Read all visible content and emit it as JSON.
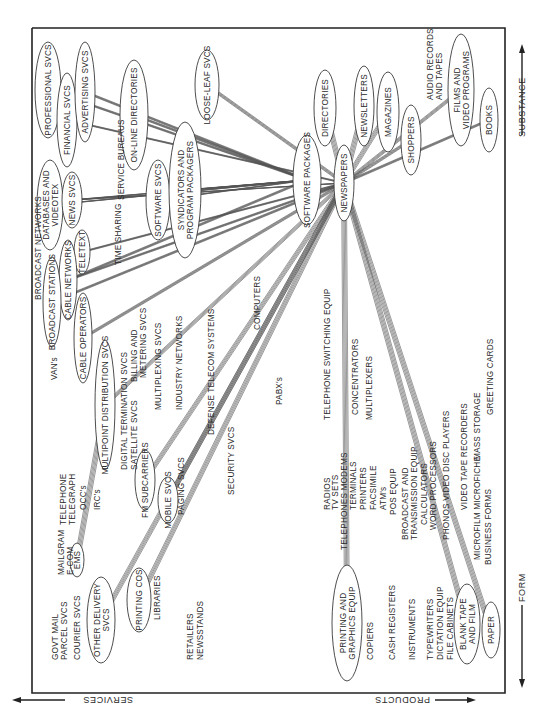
{
  "diagram": {
    "axes": {
      "top": "SUBSTANCE",
      "bottom": "FORM",
      "left": "SERVICES",
      "right": "PRODUCTS"
    },
    "nodes": [
      {
        "id": "professional",
        "lines": [
          "PROFESSIONAL SVCS"
        ],
        "cx": 48,
        "cy": 90,
        "rx": 13,
        "ry": 48
      },
      {
        "id": "financial",
        "lines": [
          "FINANCIAL SVCS"
        ],
        "cx": 67,
        "cy": 120,
        "rx": 10,
        "ry": 47
      },
      {
        "id": "advertising",
        "lines": [
          "ADVERTISING SVCS"
        ],
        "cx": 85,
        "cy": 92,
        "rx": 10,
        "ry": 50
      },
      {
        "id": "online-dir",
        "lines": [
          "ON-LINE DIRECTORIES"
        ],
        "cx": 134,
        "cy": 115,
        "rx": 14,
        "ry": 55
      },
      {
        "id": "loose-leaf",
        "lines": [
          "LOOSE-LEAF SVCS"
        ],
        "cx": 207,
        "cy": 85,
        "rx": 12,
        "ry": 35
      },
      {
        "id": "databases",
        "lines": [
          "DATABASES AND",
          "VIDEOTEX"
        ],
        "cx": 50,
        "cy": 205,
        "rx": 13,
        "ry": 45
      },
      {
        "id": "news-svcs",
        "lines": [
          "NEWS SVCS"
        ],
        "cx": 72,
        "cy": 200,
        "rx": 10,
        "ry": 28
      },
      {
        "id": "software-svcs",
        "lines": [
          "SOFTWARE SVCS"
        ],
        "cx": 158,
        "cy": 200,
        "rx": 12,
        "ry": 40
      },
      {
        "id": "syndicators",
        "lines": [
          "SYNDICATORS AND",
          "PROGRAM PACKAGERS"
        ],
        "cx": 185,
        "cy": 190,
        "rx": 16,
        "ry": 68
      },
      {
        "id": "teletext",
        "lines": [
          "TELETEXT"
        ],
        "cx": 82,
        "cy": 252,
        "rx": 8,
        "ry": 22
      },
      {
        "id": "cable-networks",
        "lines": [
          "CABLE NETWORKS"
        ],
        "cx": 68,
        "cy": 280,
        "rx": 9,
        "ry": 40
      },
      {
        "id": "broadcast-stations",
        "lines": [
          "BROADCAST STATIONS"
        ],
        "cx": 52,
        "cy": 302,
        "rx": 9,
        "ry": 45
      },
      {
        "id": "cable-operators",
        "lines": [
          "CABLE OPERATORS"
        ],
        "cx": 83,
        "cy": 338,
        "rx": 9,
        "ry": 45
      },
      {
        "id": "multipoint",
        "lines": [
          "MULTIPOINT DISTRIBUTION SVCS"
        ],
        "cx": 105,
        "cy": 405,
        "rx": 10,
        "ry": 65
      },
      {
        "id": "fm-subcarriers",
        "lines": [
          "FM SUBCARRIERS"
        ],
        "cx": 145,
        "cy": 480,
        "rx": 10,
        "ry": 30
      },
      {
        "id": "mobile-svcs",
        "lines": [
          "MOBILE SVCS"
        ],
        "cx": 168,
        "cy": 500,
        "rx": 10,
        "ry": 23
      },
      {
        "id": "ems",
        "lines": [
          "EMS"
        ],
        "cx": 77,
        "cy": 560,
        "rx": 7,
        "ry": 17
      },
      {
        "id": "other-delivery",
        "lines": [
          "OTHER DELIVERY",
          "SVCS"
        ],
        "cx": 101,
        "cy": 620,
        "rx": 14,
        "ry": 43
      },
      {
        "id": "printing-cos",
        "lines": [
          "PRINTING COS"
        ],
        "cx": 139,
        "cy": 600,
        "rx": 12,
        "ry": 32
      },
      {
        "id": "software-packages",
        "lines": [
          "SOFTWARE PACKAGES"
        ],
        "cx": 307,
        "cy": 180,
        "rx": 14,
        "ry": 45
      },
      {
        "id": "newspapers",
        "lines": [
          "NEWSPAPERS"
        ],
        "cx": 344,
        "cy": 183,
        "rx": 10,
        "ry": 38
      },
      {
        "id": "directories",
        "lines": [
          "DIRECTORIES"
        ],
        "cx": 325,
        "cy": 108,
        "rx": 11,
        "ry": 38
      },
      {
        "id": "newsletters",
        "lines": [
          "NEWSLETTERS"
        ],
        "cx": 364,
        "cy": 106,
        "rx": 10,
        "ry": 40
      },
      {
        "id": "magazines",
        "lines": [
          "MAGAZINES"
        ],
        "cx": 388,
        "cy": 112,
        "rx": 11,
        "ry": 40
      },
      {
        "id": "shoppers",
        "lines": [
          "SHOPPERS"
        ],
        "cx": 411,
        "cy": 140,
        "rx": 10,
        "ry": 35
      },
      {
        "id": "films",
        "lines": [
          "FILMS AND",
          "VIDEO PROGRAMS"
        ],
        "cx": 461,
        "cy": 90,
        "rx": 13,
        "ry": 56
      },
      {
        "id": "books",
        "lines": [
          "BOOKS"
        ],
        "cx": 489,
        "cy": 120,
        "rx": 9,
        "ry": 32
      },
      {
        "id": "printing-equip",
        "lines": [
          "PRINTING AND",
          "GRAPHICS EQUIP"
        ],
        "cx": 347,
        "cy": 623,
        "rx": 15,
        "ry": 58
      },
      {
        "id": "blank-tape",
        "lines": [
          "BLANK TAPE",
          "AND FILM"
        ],
        "cx": 467,
        "cy": 624,
        "rx": 13,
        "ry": 40
      },
      {
        "id": "paper",
        "lines": [
          "PAPER"
        ],
        "cx": 491,
        "cy": 630,
        "rx": 9,
        "ry": 28
      }
    ],
    "labels": [
      {
        "id": "service-bureaus",
        "text": "SERVICE BUREAUS",
        "x": 124,
        "y": 200
      },
      {
        "id": "time-sharing",
        "text": "TIME SHARING",
        "x": 121,
        "y": 265
      },
      {
        "id": "audio-records",
        "text": "AUDIO RECORDS",
        "x": 433,
        "y": 100
      },
      {
        "id": "and-tapes",
        "text": "AND TAPES",
        "x": 442,
        "y": 100
      },
      {
        "id": "broadcast-networks",
        "text": "BROADCAST NETWORKS",
        "x": 41,
        "y": 300
      },
      {
        "id": "vans",
        "text": "VAN's",
        "x": 57,
        "y": 380
      },
      {
        "id": "billing",
        "text": "BILLING AND",
        "x": 137,
        "y": 382
      },
      {
        "id": "metering",
        "text": "METERING SVCS",
        "x": 146,
        "y": 378
      },
      {
        "id": "multiplexing",
        "text": "MULTIPLEXING SVCS",
        "x": 161,
        "y": 410
      },
      {
        "id": "industry-networks",
        "text": "INDUSTRY NETWORKS",
        "x": 182,
        "y": 410
      },
      {
        "id": "defense",
        "text": "DEFENSE TELECOM SYSTEMS",
        "x": 214,
        "y": 435
      },
      {
        "id": "computers",
        "text": "COMPUTERS",
        "x": 260,
        "y": 330
      },
      {
        "id": "digital-termination",
        "text": "DIGITAL TERMINATION SVCS",
        "x": 127,
        "y": 470
      },
      {
        "id": "satellite",
        "text": "SATELLITE SVCS",
        "x": 137,
        "y": 470
      },
      {
        "id": "paging",
        "text": "PAGING SVCS",
        "x": 184,
        "y": 515
      },
      {
        "id": "security",
        "text": "SECURITY SVCS",
        "x": 234,
        "y": 495
      },
      {
        "id": "pabx",
        "text": "PABX's",
        "x": 282,
        "y": 405
      },
      {
        "id": "telephone-switching",
        "text": "TELEPHONE SWITCHING EQUIP",
        "x": 330,
        "y": 420
      },
      {
        "id": "concentrators",
        "text": "CONCENTRATORS",
        "x": 358,
        "y": 415
      },
      {
        "id": "multiplexers",
        "text": "MULTIPLEXERS",
        "x": 372,
        "y": 420
      },
      {
        "id": "mass-storage",
        "text": "MASS STORAGE",
        "x": 480,
        "y": 460
      },
      {
        "id": "greeting-cards",
        "text": "GREETING CARDS",
        "x": 493,
        "y": 415
      },
      {
        "id": "telephone",
        "text": "TELEPHONE",
        "x": 66,
        "y": 525
      },
      {
        "id": "telegraph",
        "text": "TELEGRAPH",
        "x": 75,
        "y": 525
      },
      {
        "id": "occs",
        "text": "OCC's",
        "x": 86,
        "y": 510
      },
      {
        "id": "ircs",
        "text": "IRC's",
        "x": 100,
        "y": 510
      },
      {
        "id": "mailgram",
        "text": "MAILGRAM",
        "x": 64,
        "y": 575
      },
      {
        "id": "e-com",
        "text": "E-COM",
        "x": 73,
        "y": 575
      },
      {
        "id": "govt-mail",
        "text": "GOVT MAIL",
        "x": 58,
        "y": 660
      },
      {
        "id": "parcel",
        "text": "PARCEL SVCS",
        "x": 67,
        "y": 660
      },
      {
        "id": "courier",
        "text": "COURIER SVCS",
        "x": 80,
        "y": 660
      },
      {
        "id": "libraries",
        "text": "LIBRARIES",
        "x": 160,
        "y": 620
      },
      {
        "id": "retailers",
        "text": "RETAILERS",
        "x": 193,
        "y": 660
      },
      {
        "id": "newsstands",
        "text": "NEWSSTANDS",
        "x": 203,
        "y": 660
      },
      {
        "id": "radios",
        "text": "RADIOS",
        "x": 330,
        "y": 510
      },
      {
        "id": "tv-sets",
        "text": "TV SETS",
        "x": 338,
        "y": 510
      },
      {
        "id": "telephones-modems",
        "text": "TELEPHONES  MODEMS",
        "x": 347,
        "y": 550
      },
      {
        "id": "terminals",
        "text": "TERMINALS",
        "x": 356,
        "y": 510
      },
      {
        "id": "printers",
        "text": "PRINTERS",
        "x": 366,
        "y": 510
      },
      {
        "id": "facsimile",
        "text": "FACSIMILE",
        "x": 376,
        "y": 510
      },
      {
        "id": "atms",
        "text": "ATM's",
        "x": 386,
        "y": 510
      },
      {
        "id": "pos-equip",
        "text": "POS EQUIP",
        "x": 396,
        "y": 515
      },
      {
        "id": "broadcast-and",
        "text": "BROADCAST AND",
        "x": 408,
        "y": 540
      },
      {
        "id": "transmission",
        "text": "TRANSMISSION EQUIP",
        "x": 417,
        "y": 540
      },
      {
        "id": "calculators",
        "text": "CALCULATORS",
        "x": 427,
        "y": 525
      },
      {
        "id": "word-processors",
        "text": "WORD PROCESSORS",
        "x": 436,
        "y": 530
      },
      {
        "id": "phonos",
        "text": "PHONOS  VIDEO DISC PLAYERS",
        "x": 449,
        "y": 540
      },
      {
        "id": "video-tape",
        "text": "VIDEO TAPE RECORDERS",
        "x": 467,
        "y": 510
      },
      {
        "id": "microfilm",
        "text": "MICROFILM MICROFICHE",
        "x": 480,
        "y": 560
      },
      {
        "id": "business-forms",
        "text": "BUSINESS FORMS",
        "x": 491,
        "y": 565
      },
      {
        "id": "copiers",
        "text": "COPIERS",
        "x": 373,
        "y": 660
      },
      {
        "id": "cash-registers",
        "text": "CASH REGISTERS",
        "x": 395,
        "y": 660
      },
      {
        "id": "instruments",
        "text": "INSTRUMENTS",
        "x": 415,
        "y": 660
      },
      {
        "id": "typewriters",
        "text": "TYPEWRITERS",
        "x": 433,
        "y": 660
      },
      {
        "id": "dictation",
        "text": "DICTATION EQUIP",
        "x": 443,
        "y": 660
      },
      {
        "id": "file-cabinets",
        "text": "FILE CABINETS",
        "x": 453,
        "y": 660
      }
    ],
    "edges": [
      [
        "professional",
        "software-packages"
      ],
      [
        "advertising",
        "software-packages"
      ],
      [
        "financial",
        "newspapers"
      ],
      [
        "online-dir",
        "software-packages"
      ],
      [
        "loose-leaf",
        "newspapers"
      ],
      [
        "databases",
        "software-packages"
      ],
      [
        "news-svcs",
        "software-packages"
      ],
      [
        "news-svcs",
        "newspapers"
      ],
      [
        "software-svcs",
        "software-packages"
      ],
      [
        "syndicators",
        "software-packages"
      ],
      [
        "teletext",
        "newspapers"
      ],
      [
        "cable-networks",
        "newspapers"
      ],
      [
        "cable-networks",
        "software-packages"
      ],
      [
        "broadcast-stations",
        "newspapers"
      ],
      [
        "cable-operators",
        "newspapers"
      ],
      [
        "multipoint",
        "newspapers"
      ],
      [
        "fm-subcarriers",
        "newspapers"
      ],
      [
        "mobile-svcs",
        "newspapers"
      ],
      [
        "ems",
        "multipoint"
      ],
      [
        "other-delivery",
        "newspapers"
      ],
      [
        "printing-cos",
        "newspapers"
      ],
      [
        "newspapers",
        "directories"
      ],
      [
        "newspapers",
        "newsletters"
      ],
      [
        "newspapers",
        "magazines"
      ],
      [
        "newspapers",
        "shoppers"
      ],
      [
        "newspapers",
        "films"
      ],
      [
        "newspapers",
        "books"
      ],
      [
        "newspapers",
        "blank-tape"
      ],
      [
        "newspapers",
        "paper"
      ],
      [
        "printing-equip",
        "newspapers"
      ]
    ]
  }
}
